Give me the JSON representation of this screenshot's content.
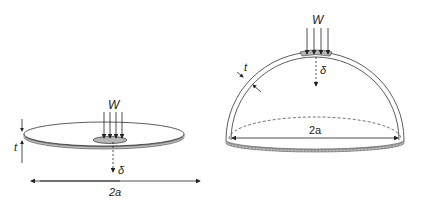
{
  "figure": {
    "left": {
      "name": "flat-disc",
      "labels": {
        "load": "W",
        "deflection": "δ",
        "thickness": "t",
        "span": "2a"
      }
    },
    "right": {
      "name": "hemispherical-dome",
      "labels": {
        "load": "W",
        "deflection": "δ",
        "thickness": "t",
        "span": "2a"
      }
    },
    "colors": {
      "stroke": "#222222",
      "shell_edge": "#9a9a9a",
      "contact_patch": "#b5b5b5"
    }
  }
}
